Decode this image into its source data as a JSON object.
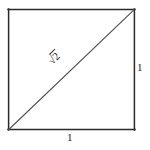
{
  "figure": {
    "kind": "geometry-diagram",
    "background_color": "#ffffff",
    "stroke_color": "#2a2a2a",
    "diagonal_stroke_color": "#555555",
    "text_color": "#1d1d1d",
    "square": {
      "left": 8,
      "top": 9,
      "right": 135,
      "bottom": 130,
      "stroke_width": 1.4
    },
    "diagonal": {
      "x1": 8,
      "y1": 130,
      "x2": 135,
      "y2": 9,
      "stroke_width": 1.1
    },
    "labels": {
      "bottom_side": "1",
      "right_side": "1",
      "diagonal_radical": "√",
      "diagonal_radicand": "2",
      "diagonal_full": "√2"
    }
  }
}
